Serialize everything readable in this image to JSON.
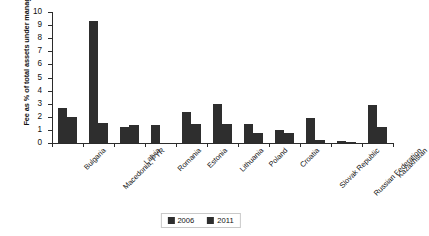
{
  "chart_data": {
    "type": "bar",
    "title": "",
    "xlabel": "",
    "ylabel": "Fee as % of total assets under management",
    "ylim": [
      0,
      10
    ],
    "ytick_labels": [
      "0",
      "1",
      "2",
      "3",
      "4",
      "5",
      "6",
      "7",
      "8",
      "9",
      "10"
    ],
    "grid": false,
    "legend_position": "bottom-center",
    "bar_color": "#2e2e2e",
    "categories": [
      "Bulgaria",
      "Macedonia, FYR",
      "Latvia",
      "Romania",
      "Estonia",
      "Lithuania",
      "Poland",
      "Croatia",
      "Slovak Republic",
      "Russian Federation",
      "Kazakhstan"
    ],
    "series": [
      {
        "name": "2006",
        "values": [
          2.7,
          9.3,
          1.2,
          1.4,
          2.35,
          3.0,
          1.45,
          1.0,
          1.9,
          0.12,
          2.9
        ]
      },
      {
        "name": "2011",
        "values": [
          2.0,
          1.55,
          1.4,
          0.0,
          1.45,
          1.45,
          0.8,
          0.75,
          0.25,
          0.1,
          1.2
        ]
      }
    ]
  },
  "legend": {
    "items": [
      {
        "label": "2006"
      },
      {
        "label": "2011"
      }
    ]
  }
}
